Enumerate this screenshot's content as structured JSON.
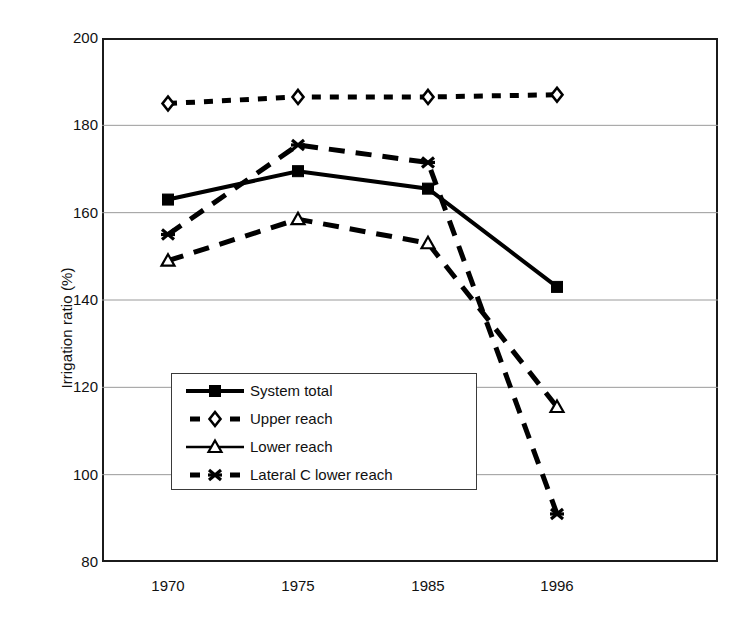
{
  "chart_data": {
    "type": "line",
    "title": "",
    "xlabel": "",
    "ylabel": "Irrigation ratio (%)",
    "categories": [
      "1970",
      "1975",
      "1985",
      "1996"
    ],
    "ylim": [
      80,
      200
    ],
    "yticks": [
      200,
      180,
      160,
      140,
      120,
      100,
      80
    ],
    "grid": "horizontal",
    "legend_position": "inside-lower-left",
    "series": [
      {
        "name": "System total",
        "marker": "filled-square",
        "line_style": "solid",
        "color": "#000000",
        "values": [
          163,
          169.5,
          165.5,
          143
        ]
      },
      {
        "name": "Upper reach",
        "marker": "open-diamond",
        "line_style": "dotted",
        "color": "#000000",
        "values": [
          185,
          186.5,
          186.5,
          187
        ]
      },
      {
        "name": "Lower reach",
        "marker": "open-triangle",
        "line_style": "dashed",
        "color": "#000000",
        "values": [
          149,
          158.5,
          153,
          115.5
        ]
      },
      {
        "name": "Lateral C lower reach",
        "marker": "asterisk",
        "line_style": "dashed",
        "color": "#000000",
        "values": [
          155,
          175.5,
          171.5,
          91
        ]
      }
    ]
  },
  "axes": {
    "y_title": "Irrigation ratio (%)",
    "y_tick_labels": [
      "200",
      "180",
      "160",
      "140",
      "120",
      "100",
      "80"
    ],
    "x_tick_labels": [
      "1970",
      "1975",
      "1985",
      "1996"
    ]
  },
  "legend": {
    "items": [
      {
        "label": "System total",
        "marker": "filled-square",
        "line_style": "solid"
      },
      {
        "label": "Upper reach",
        "marker": "open-diamond",
        "line_style": "dotted"
      },
      {
        "label": "Lower reach",
        "marker": "open-triangle",
        "line_style": "solid"
      },
      {
        "label": "Lateral C lower reach",
        "marker": "asterisk",
        "line_style": "dashed"
      }
    ]
  },
  "colors": {
    "ink": "#000000",
    "frame": "#1b1b1b",
    "gridline": "#9a9a9a",
    "background": "#ffffff"
  }
}
